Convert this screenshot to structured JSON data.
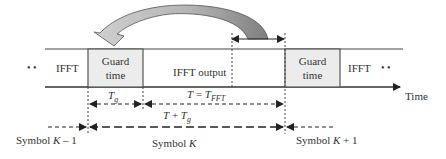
{
  "diagram": {
    "frame": {
      "left_dots": "• •",
      "right_dots": "• •",
      "segments": [
        {
          "id": "ifft-prev",
          "label": "IFFT"
        },
        {
          "id": "guard-1",
          "label_line1": "Guard",
          "label_line2": "time"
        },
        {
          "id": "ifft-output",
          "label": "IFFT output"
        },
        {
          "id": "guard-2",
          "label_line1": "Guard",
          "label_line2": "time"
        },
        {
          "id": "ifft-next",
          "label": "IFFT"
        }
      ]
    },
    "axis": {
      "label": "Time"
    },
    "intervals": {
      "tg": {
        "symbol": "T",
        "subscript": "g"
      },
      "t_fft": {
        "lhs": "T",
        "eq": " = ",
        "rhs": "T",
        "subscript": "FFT"
      },
      "t_plus_tg": {
        "lhs": "T",
        "plus": " + ",
        "rhs": "T",
        "subscript": "g"
      }
    },
    "symbols": {
      "prev": {
        "prefix": "Symbol ",
        "var": "K",
        "suffix": " – 1"
      },
      "current": {
        "prefix": "Symbol ",
        "var": "K",
        "suffix": ""
      },
      "next": {
        "prefix": "Symbol ",
        "var": "K",
        "suffix": " + 1"
      }
    },
    "colors": {
      "line": "#333333",
      "guard_fill": "#ececec",
      "arrow_light": "#c8c8c8",
      "arrow_dark": "#8a8a8a"
    }
  }
}
